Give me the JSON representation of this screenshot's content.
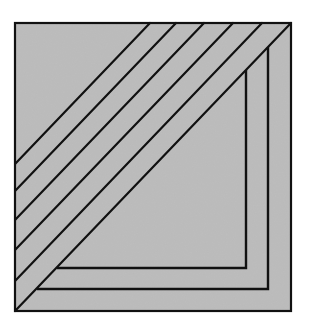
{
  "figure": {
    "background": "#ffffff",
    "fill_color": "#bdbdbd",
    "stroke_color": "#111111",
    "square": {
      "x1": 15,
      "y1": 23,
      "x2": 291,
      "y2": 311
    },
    "diagonals": [
      {
        "x1": 150,
        "y1": 23,
        "x2": 15,
        "y2": 164
      },
      {
        "x1": 176,
        "y1": 23,
        "x2": 15,
        "y2": 191
      },
      {
        "x1": 204,
        "y1": 23,
        "x2": 15,
        "y2": 220
      },
      {
        "x1": 233,
        "y1": 23,
        "x2": 15,
        "y2": 250
      },
      {
        "x1": 262,
        "y1": 23,
        "x2": 15,
        "y2": 281
      },
      {
        "x1": 291,
        "y1": 23,
        "x2": 15,
        "y2": 311
      }
    ],
    "l_shapes": [
      {
        "name": "outer-l",
        "points": "268,47 268,289 37,289"
      },
      {
        "name": "inner-l",
        "points": "246,70 246,268 57,268"
      }
    ]
  }
}
